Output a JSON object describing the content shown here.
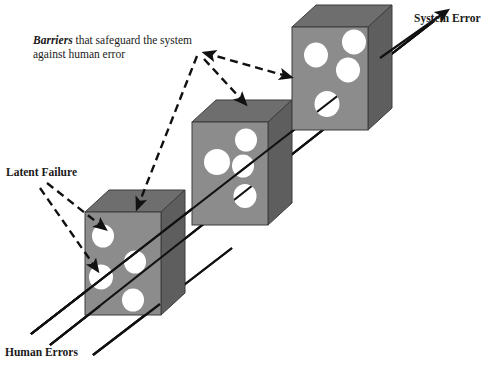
{
  "diagram": {
    "type": "conceptual-diagram",
    "background_color": "#ffffff",
    "labels": {
      "barriers_emphasis": "Barriers",
      "barriers_rest": " that safeguard the system against human error",
      "latent_failure": "Latent Failure",
      "human_errors": "Human Errors",
      "system_error": "System Error"
    },
    "colors": {
      "slab_front": "#8c8c8c",
      "slab_top": "#6e6e6e",
      "slab_side": "#5e5e5e",
      "slab_outline": "#3d3d3d",
      "hole_fill": "#ffffff",
      "line": "#111111",
      "dashed_line": "#111111",
      "text": "#1a1a1a"
    },
    "slabs": [
      {
        "name": "front-barrier-slab",
        "order": 1,
        "front_face": {
          "x": 85,
          "y": 212,
          "width": 76,
          "height": 103
        },
        "depth_x": 24,
        "depth_y": -22,
        "holes": [
          {
            "cx": 103,
            "cy": 236,
            "rx": 11,
            "ry": 11.5
          },
          {
            "cx": 101,
            "cy": 277,
            "rx": 12,
            "ry": 12.5
          },
          {
            "cx": 135,
            "cy": 262,
            "rx": 11,
            "ry": 11.5
          },
          {
            "cx": 133,
            "cy": 300,
            "rx": 11,
            "ry": 11.5
          }
        ]
      },
      {
        "name": "middle-barrier-slab",
        "order": 2,
        "front_face": {
          "x": 192,
          "y": 122,
          "width": 76,
          "height": 103
        },
        "depth_x": 24,
        "depth_y": -22,
        "holes": [
          {
            "cx": 246,
            "cy": 140,
            "rx": 11,
            "ry": 11.5
          },
          {
            "cx": 217,
            "cy": 162,
            "rx": 13,
            "ry": 13
          },
          {
            "cx": 243,
            "cy": 166,
            "rx": 11,
            "ry": 11.5
          },
          {
            "cx": 245,
            "cy": 196,
            "rx": 11.5,
            "ry": 12
          }
        ]
      },
      {
        "name": "back-barrier-slab",
        "order": 3,
        "front_face": {
          "x": 292,
          "y": 27,
          "width": 76,
          "height": 103
        },
        "depth_x": 24,
        "depth_y": -22,
        "holes": [
          {
            "cx": 354,
            "cy": 42,
            "rx": 12,
            "ry": 12.5
          },
          {
            "cx": 316,
            "cy": 55,
            "rx": 12,
            "ry": 12.5
          },
          {
            "cx": 348,
            "cy": 70,
            "rx": 12,
            "ry": 12.5
          },
          {
            "cx": 327,
            "cy": 104,
            "rx": 12.5,
            "ry": 13
          }
        ]
      }
    ],
    "trajectory_lines": [
      {
        "name": "human-error-trajectory-1",
        "x1": 31,
        "y1": 334,
        "x2": 440,
        "y2": 16,
        "arrow": true
      },
      {
        "name": "human-error-trajectory-2",
        "x1": 50,
        "y1": 345,
        "x2": 333,
        "y2": 122,
        "arrow": false
      },
      {
        "name": "human-error-trajectory-3",
        "x1": 93,
        "y1": 355,
        "x2": 232,
        "y2": 248,
        "arrow": false
      }
    ],
    "dashed_connectors": [
      {
        "name": "barriers-to-front-slab",
        "points": "197,54 137,207",
        "arrow_end": true
      },
      {
        "name": "barriers-to-middle-slab",
        "points": "203,57 241,104",
        "arrow_end": true
      },
      {
        "name": "barriers-to-back-slab",
        "points": "199,52 288,76",
        "arrow_start": true,
        "arrow_end": true
      },
      {
        "name": "latent-failure-to-hole-1",
        "points": "49,185 104,228",
        "arrow_end": true
      },
      {
        "name": "latent-failure-to-hole-2",
        "points": "43,190 98,268",
        "arrow_end": true
      }
    ]
  }
}
